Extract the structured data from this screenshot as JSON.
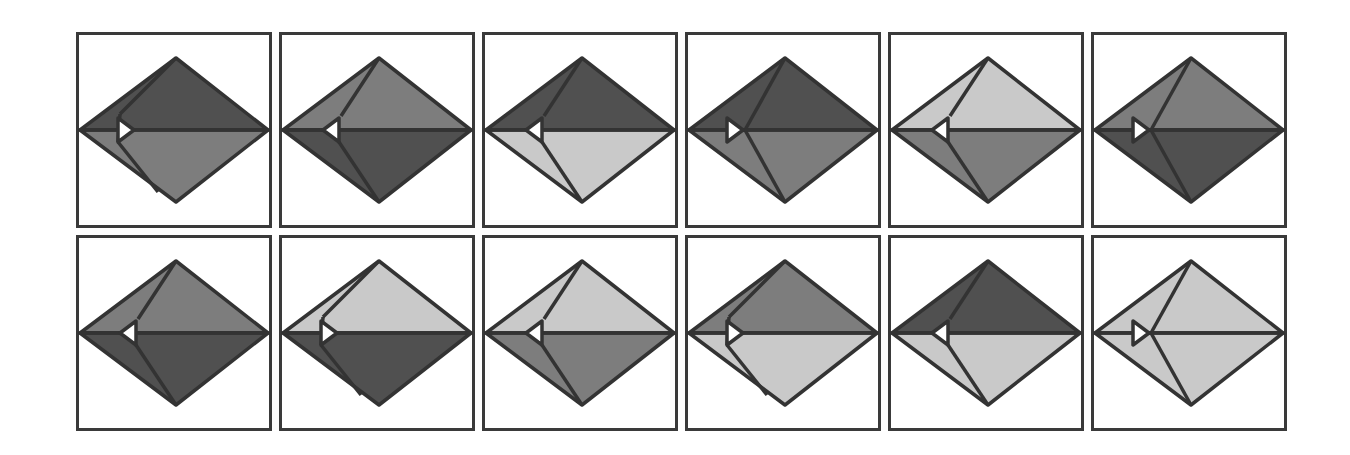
{
  "colors": {
    "dark": "#505050",
    "medium": "#7d7d7d",
    "light": "#c9c9c9",
    "stroke": "#333333",
    "notch": "#ffffff",
    "border": "#3a3a3a"
  },
  "layout": {
    "columns": 6,
    "rows": 2,
    "cell_size": 196,
    "col_step": 203,
    "row_step": 203
  },
  "panels": [
    {
      "id": 1,
      "row": 0,
      "col": 0,
      "upper": "dark",
      "lower": "medium",
      "notch": "right",
      "style": "flap"
    },
    {
      "id": 2,
      "row": 0,
      "col": 1,
      "upper": "medium",
      "lower": "dark",
      "notch": "left",
      "style": "fold"
    },
    {
      "id": 3,
      "row": 0,
      "col": 2,
      "upper": "dark",
      "lower": "light",
      "notch": "left",
      "style": "fold"
    },
    {
      "id": 4,
      "row": 0,
      "col": 3,
      "upper": "dark",
      "lower": "medium",
      "notch": "right",
      "style": "straight"
    },
    {
      "id": 5,
      "row": 0,
      "col": 4,
      "upper": "light",
      "lower": "medium",
      "notch": "left",
      "style": "fold"
    },
    {
      "id": 6,
      "row": 0,
      "col": 5,
      "upper": "medium",
      "lower": "dark",
      "notch": "right",
      "style": "straight"
    },
    {
      "id": 7,
      "row": 1,
      "col": 0,
      "upper": "medium",
      "lower": "dark",
      "notch": "left",
      "style": "fold"
    },
    {
      "id": 8,
      "row": 1,
      "col": 1,
      "upper": "light",
      "lower": "dark",
      "notch": "right",
      "style": "flap"
    },
    {
      "id": 9,
      "row": 1,
      "col": 2,
      "upper": "light",
      "lower": "medium",
      "notch": "left",
      "style": "fold"
    },
    {
      "id": 10,
      "row": 1,
      "col": 3,
      "upper": "medium",
      "lower": "light",
      "notch": "right",
      "style": "flap"
    },
    {
      "id": 11,
      "row": 1,
      "col": 4,
      "upper": "dark",
      "lower": "light",
      "notch": "left",
      "style": "fold"
    },
    {
      "id": 12,
      "row": 1,
      "col": 5,
      "upper": "light",
      "lower": "light",
      "notch": "right",
      "style": "straight"
    }
  ]
}
